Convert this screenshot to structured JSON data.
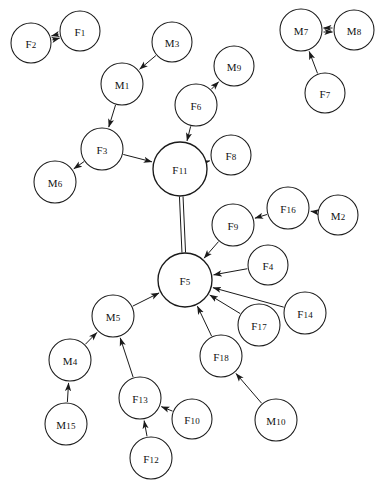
{
  "diagram": {
    "background_color": "#ffffff",
    "node_fill": "#ffffff",
    "node_stroke": "#1a1a1a",
    "edge_color": "#1a1a1a",
    "node_count": 26,
    "edge_count": 24
  },
  "nodes": [
    {
      "id": "F2",
      "label": "F2",
      "prefix": "F",
      "index": "2",
      "cx": 31,
      "cy": 43,
      "r": 20
    },
    {
      "id": "F1",
      "label": "F1",
      "prefix": "F",
      "index": "1",
      "cx": 80,
      "cy": 31,
      "r": 20
    },
    {
      "id": "M3",
      "label": "M3",
      "prefix": "M",
      "index": "3",
      "cx": 172,
      "cy": 42,
      "r": 20
    },
    {
      "id": "M1",
      "label": "M1",
      "prefix": "M",
      "index": "1",
      "cx": 122,
      "cy": 84,
      "r": 21
    },
    {
      "id": "M9",
      "label": "M9",
      "prefix": "M",
      "index": "9",
      "cx": 234,
      "cy": 66,
      "r": 20
    },
    {
      "id": "F6",
      "label": "F6",
      "prefix": "F",
      "index": "6",
      "cx": 196,
      "cy": 105,
      "r": 21
    },
    {
      "id": "F3",
      "label": "F3",
      "prefix": "F",
      "index": "3",
      "cx": 102,
      "cy": 149,
      "r": 21
    },
    {
      "id": "M6",
      "label": "M6",
      "prefix": "M",
      "index": "6",
      "cx": 55,
      "cy": 182,
      "r": 21
    },
    {
      "id": "F11",
      "label": "F11",
      "prefix": "F",
      "index": "11",
      "cx": 180,
      "cy": 169,
      "r": 27
    },
    {
      "id": "F8",
      "label": "F8",
      "prefix": "F",
      "index": "8",
      "cx": 231,
      "cy": 155,
      "r": 20
    },
    {
      "id": "M7",
      "label": "M7",
      "prefix": "M",
      "index": "7",
      "cx": 301,
      "cy": 30,
      "r": 21
    },
    {
      "id": "M8",
      "label": "M8",
      "prefix": "M",
      "index": "8",
      "cx": 354,
      "cy": 30,
      "r": 20
    },
    {
      "id": "F7",
      "label": "F7",
      "prefix": "F",
      "index": "7",
      "cx": 325,
      "cy": 93,
      "r": 20
    },
    {
      "id": "F16",
      "label": "F16",
      "prefix": "F",
      "index": "16",
      "cx": 288,
      "cy": 208,
      "r": 21
    },
    {
      "id": "M2",
      "label": "M2",
      "prefix": "M",
      "index": "2",
      "cx": 338,
      "cy": 215,
      "r": 20
    },
    {
      "id": "F9",
      "label": "F9",
      "prefix": "F",
      "index": "9",
      "cx": 233,
      "cy": 225,
      "r": 21
    },
    {
      "id": "F4",
      "label": "F4",
      "prefix": "F",
      "index": "4",
      "cx": 268,
      "cy": 265,
      "r": 20
    },
    {
      "id": "F5",
      "label": "F5",
      "prefix": "F",
      "index": "5",
      "cx": 185,
      "cy": 280,
      "r": 27
    },
    {
      "id": "F14",
      "label": "F14",
      "prefix": "F",
      "index": "14",
      "cx": 305,
      "cy": 313,
      "r": 21
    },
    {
      "id": "F17",
      "label": "F17",
      "prefix": "F",
      "index": "17",
      "cx": 259,
      "cy": 325,
      "r": 21
    },
    {
      "id": "M5",
      "label": "M5",
      "prefix": "M",
      "index": "5",
      "cx": 113,
      "cy": 316,
      "r": 21
    },
    {
      "id": "F18",
      "label": "F18",
      "prefix": "F",
      "index": "18",
      "cx": 221,
      "cy": 356,
      "r": 21
    },
    {
      "id": "M4",
      "label": "M4",
      "prefix": "M",
      "index": "4",
      "cx": 70,
      "cy": 360,
      "r": 21
    },
    {
      "id": "F13",
      "label": "F13",
      "prefix": "F",
      "index": "13",
      "cx": 140,
      "cy": 398,
      "r": 21
    },
    {
      "id": "F10",
      "label": "F10",
      "prefix": "F",
      "index": "10",
      "cx": 192,
      "cy": 419,
      "r": 20
    },
    {
      "id": "M10",
      "label": "M10",
      "prefix": "M",
      "index": "10",
      "cx": 276,
      "cy": 420,
      "r": 21
    },
    {
      "id": "M15",
      "label": "M15",
      "prefix": "M",
      "index": "15",
      "cx": 66,
      "cy": 424,
      "r": 21
    },
    {
      "id": "F12",
      "label": "F12",
      "prefix": "F",
      "index": "12",
      "cx": 151,
      "cy": 458,
      "r": 21
    }
  ],
  "edges": [
    {
      "from": "F1",
      "to": "F2",
      "kind": "bidirectional-double",
      "arrow": "both"
    },
    {
      "from": "M3",
      "to": "M1",
      "kind": "directed",
      "arrow": "to"
    },
    {
      "from": "M1",
      "to": "F3",
      "kind": "directed",
      "arrow": "to"
    },
    {
      "from": "F3",
      "to": "M6",
      "kind": "directed",
      "arrow": "to"
    },
    {
      "from": "F3",
      "to": "F11",
      "kind": "directed",
      "arrow": "to"
    },
    {
      "from": "F6",
      "to": "M9",
      "kind": "directed",
      "arrow": "to"
    },
    {
      "from": "F6",
      "to": "F11",
      "kind": "directed",
      "arrow": "to"
    },
    {
      "from": "F11",
      "to": "F8",
      "kind": "directed",
      "arrow": "to"
    },
    {
      "from": "F11",
      "to": "F5",
      "kind": "parallel-double",
      "arrow": "none"
    },
    {
      "from": "M7",
      "to": "M8",
      "kind": "bidirectional-double",
      "arrow": "both"
    },
    {
      "from": "F7",
      "to": "M7",
      "kind": "directed",
      "arrow": "to"
    },
    {
      "from": "M2",
      "to": "F16",
      "kind": "directed",
      "arrow": "to"
    },
    {
      "from": "F16",
      "to": "F9",
      "kind": "directed",
      "arrow": "to"
    },
    {
      "from": "F9",
      "to": "F5",
      "kind": "directed",
      "arrow": "to"
    },
    {
      "from": "F4",
      "to": "F5",
      "kind": "directed",
      "arrow": "to"
    },
    {
      "from": "F14",
      "to": "F5",
      "kind": "directed",
      "arrow": "to"
    },
    {
      "from": "F17",
      "to": "F5",
      "kind": "directed",
      "arrow": "to"
    },
    {
      "from": "F18",
      "to": "F5",
      "kind": "directed",
      "arrow": "to"
    },
    {
      "from": "M10",
      "to": "F18",
      "kind": "directed",
      "arrow": "to"
    },
    {
      "from": "M5",
      "to": "F5",
      "kind": "directed",
      "arrow": "to"
    },
    {
      "from": "M4",
      "to": "M5",
      "kind": "directed",
      "arrow": "to"
    },
    {
      "from": "M15",
      "to": "M4",
      "kind": "directed",
      "arrow": "to"
    },
    {
      "from": "F13",
      "to": "M5",
      "kind": "directed",
      "arrow": "to"
    },
    {
      "from": "F10",
      "to": "F13",
      "kind": "directed",
      "arrow": "to"
    },
    {
      "from": "F12",
      "to": "F13",
      "kind": "directed",
      "arrow": "to"
    }
  ]
}
